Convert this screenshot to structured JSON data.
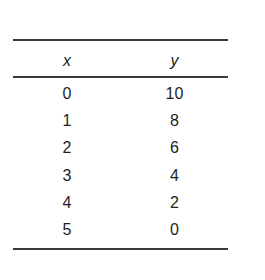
{
  "figure": {
    "type": "data-table",
    "background_color": "#ffffff",
    "rule_color": "#3a3a3a",
    "text_color": "#231f20"
  },
  "table": {
    "headers": [
      {
        "label": "x",
        "style": "italic"
      },
      {
        "label": "y",
        "style": "italic"
      }
    ],
    "rows": [
      {
        "x": "0",
        "y": "10"
      },
      {
        "x": "1",
        "y": "8"
      },
      {
        "x": "2",
        "y": "6"
      },
      {
        "x": "3",
        "y": "4"
      },
      {
        "x": "4",
        "y": "2"
      },
      {
        "x": "5",
        "y": "0"
      }
    ]
  },
  "chart_data": {
    "type": "table",
    "title": "",
    "xlabel": "x",
    "ylabel": "y",
    "columns": [
      "x",
      "y"
    ],
    "x": [
      0,
      1,
      2,
      3,
      4,
      5
    ],
    "series": [
      {
        "name": "y",
        "values": [
          10,
          8,
          6,
          4,
          2,
          0
        ]
      }
    ],
    "rows": [
      [
        0,
        10
      ],
      [
        1,
        8
      ],
      [
        2,
        6
      ],
      [
        3,
        4
      ],
      [
        4,
        2
      ],
      [
        5,
        0
      ]
    ],
    "grid": false,
    "legend": "none"
  }
}
